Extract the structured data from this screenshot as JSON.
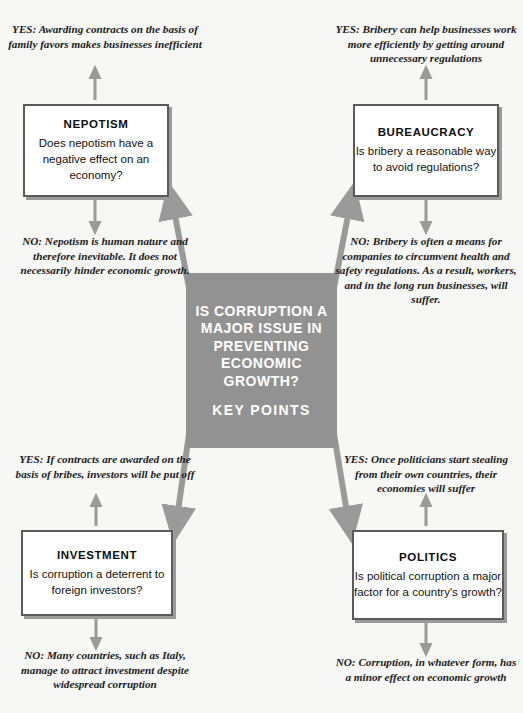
{
  "center": {
    "main_question": "IS CORRUPTION A MAJOR ISSUE IN PREVENTING ECONOMIC GROWTH?",
    "subtitle": "KEY POINTS",
    "fill_color": "#929292",
    "text_color": "#ffffff"
  },
  "colors": {
    "background": "#f7f7f5",
    "arrow": "#9a9a9a",
    "box_border": "#5a5a5a",
    "box_fill": "#ffffff",
    "center_fill": "#929292",
    "text": "#111111"
  },
  "branches": [
    {
      "id": "nepotism",
      "title": "NEPOTISM",
      "question": "Does nepotism have a negative effect on an economy?",
      "yes": "YES: Awarding contracts on the basis of family favors makes businesses inefficient",
      "no": "NO: Nepotism is human nature and therefore inevitable. It does not necessarily hinder economic growth."
    },
    {
      "id": "bureaucracy",
      "title": "BUREAUCRACY",
      "question": "Is bribery a reasonable way to avoid regulations?",
      "yes": "YES: Bribery can help businesses work more efficiently by getting around unnecessary regulations",
      "no": "NO: Bribery is often a means for companies to circumvent health and safety regulations. As a result, workers, and in the long run businesses, will suffer."
    },
    {
      "id": "investment",
      "title": "INVESTMENT",
      "question": "Is corruption a deterrent to foreign investors?",
      "yes": "YES: If contracts are awarded on the basis of bribes, investors will be put off",
      "no": "NO: Many countries, such as Italy, manage to attract investment despite widespread corruption"
    },
    {
      "id": "politics",
      "title": "POLITICS",
      "question": "Is political corruption a major factor for a country's growth?",
      "yes": "YES: Once politicians start stealing from their own countries, their economies will suffer",
      "no": "NO: Corruption, in whatever form, has a minor effect on economic growth"
    }
  ]
}
